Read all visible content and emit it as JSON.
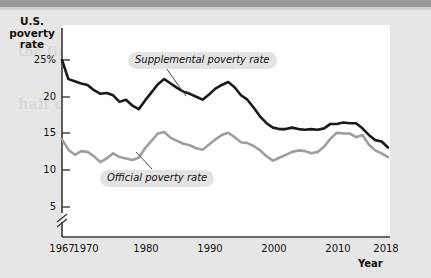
{
  "figure": {
    "y_axis_title": "U.S.\npoverty\nrate",
    "y_axis_title_lines": [
      "U.S.",
      "poverty",
      "rate"
    ],
    "x_axis_title": "Year"
  },
  "callouts": {
    "supplemental": "Supplemental poverty rate",
    "official": "Official poverty rate"
  },
  "background_bleed": {
    "line1": "the first line of text bleeding through",
    "line2": "half of your"
  },
  "chart_data": {
    "type": "line",
    "title": "",
    "subtitle": "",
    "xlabel": "Year",
    "ylabel": "U.S. poverty rate",
    "xlim": [
      1967,
      2018
    ],
    "ylim": [
      4,
      26
    ],
    "y_axis_break": true,
    "y_axis_break_below": 5,
    "grid": false,
    "legend_position": "inline-callouts",
    "ytick_labels": [
      "25%",
      "20",
      "15",
      "10",
      "5"
    ],
    "ytick_values": [
      25,
      20,
      15,
      10,
      5
    ],
    "xtick_labels": [
      "1967",
      "1970",
      "1980",
      "1990",
      "2000",
      "2010",
      "2018"
    ],
    "xtick_values": [
      1967,
      1970,
      1980,
      1990,
      2000,
      2010,
      2018
    ],
    "colors": {
      "supplemental": "#1a1a1a",
      "official": "#9e9e9e",
      "panel": "#ffffff",
      "figure_background": "#e6e6e6",
      "callout_pill": "#e3e3e3",
      "axis": "#3a3a3a"
    },
    "x": [
      1967,
      1968,
      1969,
      1970,
      1971,
      1972,
      1973,
      1974,
      1975,
      1976,
      1977,
      1978,
      1979,
      1980,
      1981,
      1982,
      1983,
      1984,
      1985,
      1986,
      1987,
      1988,
      1989,
      1990,
      1991,
      1992,
      1993,
      1994,
      1995,
      1996,
      1997,
      1998,
      1999,
      2000,
      2001,
      2002,
      2003,
      2004,
      2005,
      2006,
      2007,
      2008,
      2009,
      2010,
      2011,
      2012,
      2013,
      2014,
      2015,
      2016,
      2017,
      2018
    ],
    "series": [
      {
        "name": "Supplemental poverty rate",
        "color": "#1a1a1a",
        "values": [
          25.0,
          22.4,
          22.1,
          21.8,
          21.6,
          20.9,
          20.4,
          20.5,
          20.2,
          19.3,
          19.6,
          18.8,
          18.3,
          19.5,
          20.6,
          21.7,
          22.4,
          21.8,
          21.2,
          20.7,
          20.4,
          20.0,
          19.6,
          20.3,
          21.1,
          21.6,
          22.0,
          21.3,
          20.2,
          19.6,
          18.5,
          17.3,
          16.4,
          15.8,
          15.6,
          15.6,
          15.8,
          15.6,
          15.5,
          15.6,
          15.5,
          15.7,
          16.3,
          16.3,
          16.5,
          16.4,
          16.4,
          15.7,
          14.8,
          14.1,
          13.9,
          13.1
        ]
      },
      {
        "name": "Official poverty rate",
        "color": "#9e9e9e",
        "values": [
          14.2,
          12.8,
          12.1,
          12.6,
          12.5,
          11.9,
          11.1,
          11.6,
          12.3,
          11.8,
          11.6,
          11.4,
          11.7,
          13.0,
          14.0,
          15.0,
          15.2,
          14.4,
          14.0,
          13.6,
          13.4,
          13.0,
          12.8,
          13.5,
          14.2,
          14.8,
          15.1,
          14.5,
          13.8,
          13.7,
          13.3,
          12.7,
          11.9,
          11.3,
          11.7,
          12.1,
          12.5,
          12.7,
          12.6,
          12.3,
          12.5,
          13.2,
          14.3,
          15.1,
          15.0,
          15.0,
          14.5,
          14.8,
          13.5,
          12.7,
          12.3,
          11.8
        ]
      }
    ]
  }
}
